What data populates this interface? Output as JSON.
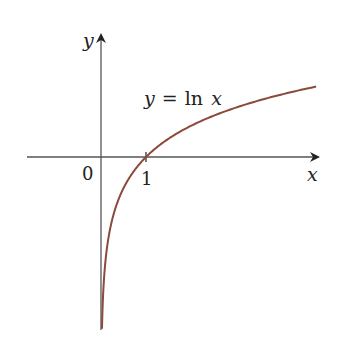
{
  "chart_data": {
    "type": "line",
    "title": "",
    "function": "y = ln x",
    "curve_label": "y = ln x",
    "xlabel": "x",
    "ylabel": "y",
    "origin_label": "0",
    "x_ticks": [
      1
    ],
    "x_tick_labels": [
      "1"
    ],
    "xlim": [
      -1.65,
      4.8
    ],
    "ylim": [
      -3.8,
      2.7
    ],
    "grid": false,
    "legend": "none",
    "series": [
      {
        "name": "ln x",
        "x": [
          0.022,
          0.05,
          0.1,
          0.2,
          0.3,
          0.5,
          0.75,
          1,
          1.5,
          2,
          2.5,
          3,
          3.5,
          4,
          4.5,
          4.78
        ],
        "y": [
          -3.81,
          -3.0,
          -2.3,
          -1.61,
          -1.2,
          -0.69,
          -0.29,
          0,
          0.41,
          0.69,
          0.92,
          1.1,
          1.25,
          1.39,
          1.5,
          1.56
        ],
        "color": "#8b4a3c"
      }
    ]
  },
  "labels": {
    "y_axis": "y",
    "x_axis": "x",
    "origin": "0",
    "tick_one": "1",
    "curve_prefix": "y",
    "curve_eq": "=",
    "curve_fn": "ln",
    "curve_var": "x"
  },
  "colors": {
    "curve": "#8b4a3c",
    "axis": "#555555"
  }
}
